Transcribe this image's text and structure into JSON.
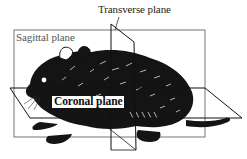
{
  "figure": {
    "labels": {
      "transverse": "Transverse plane",
      "sagittal": "Sagittal plane",
      "coronal": "Coronal plane"
    },
    "colors": {
      "background": "#ffffff",
      "ink": "#111111",
      "plane_line": "#555555"
    }
  }
}
